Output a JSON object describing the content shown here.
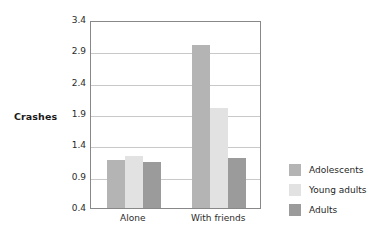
{
  "chart_data": {
    "type": "bar",
    "title": "",
    "xlabel": "",
    "ylabel": "Crashes",
    "categories": [
      "Alone",
      "With friends"
    ],
    "series": [
      {
        "name": "Adolescents",
        "color": "#b4b4b4",
        "values": [
          1.17,
          3.0
        ]
      },
      {
        "name": "Young adults",
        "color": "#e2e2e2",
        "values": [
          1.23,
          2.0
        ]
      },
      {
        "name": "Adults",
        "color": "#9b9b9b",
        "values": [
          1.13,
          1.2
        ]
      }
    ],
    "ylim": [
      0.4,
      3.4
    ],
    "yticks": [
      "3.4",
      "2.9",
      "2.4",
      "1.9",
      "1.4",
      "0.9",
      "0.4"
    ],
    "ytick_values": [
      3.4,
      2.9,
      2.4,
      1.9,
      1.4,
      0.9,
      0.4
    ],
    "grid": true,
    "legend_position": "right"
  },
  "legend": {
    "items": [
      {
        "label": "Adolescents",
        "color": "#b4b4b4"
      },
      {
        "label": "Young adults",
        "color": "#e2e2e2"
      },
      {
        "label": "Adults",
        "color": "#9b9b9b"
      }
    ]
  },
  "colors": {
    "frame": "#888888",
    "grid": "#c9c9c9",
    "text": "#2b2b2b",
    "background": "#ffffff"
  }
}
